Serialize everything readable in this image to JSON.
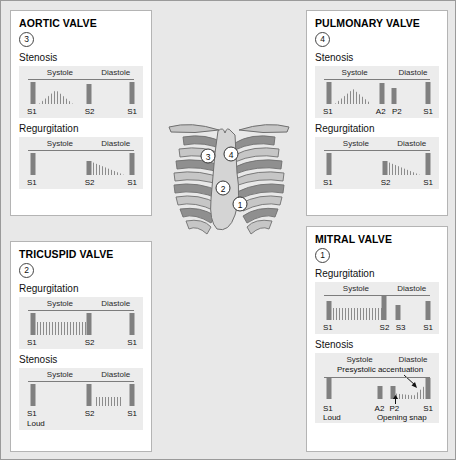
{
  "cards": {
    "aortic": {
      "title": "AORTIC VALVE",
      "site_number": "3",
      "lesions": [
        {
          "name": "Stenosis",
          "phases": [
            "Systole",
            "Diastole"
          ],
          "sounds": [
            "S1",
            "S2",
            "S1"
          ],
          "murmur_shape": "diamond",
          "murmur_phase": "systole"
        },
        {
          "name": "Regurgitation",
          "phases": [
            "Systole",
            "Diastole"
          ],
          "sounds": [
            "S1",
            "S2",
            "S1"
          ],
          "murmur_shape": "decrescendo",
          "murmur_phase": "diastole"
        }
      ]
    },
    "pulmonary": {
      "title": "PULMONARY VALVE",
      "site_number": "4",
      "lesions": [
        {
          "name": "Stenosis",
          "phases": [
            "Systole",
            "Diastole"
          ],
          "sounds": [
            "S1",
            "A2",
            "P2",
            "S1"
          ],
          "murmur_shape": "diamond",
          "murmur_phase": "systole"
        },
        {
          "name": "Regurgitation",
          "phases": [
            "Systole",
            "Diastole"
          ],
          "sounds": [
            "S1",
            "S2",
            "S1"
          ],
          "murmur_shape": "decrescendo",
          "murmur_phase": "diastole"
        }
      ]
    },
    "tricuspid": {
      "title": "TRICUSPID VALVE",
      "site_number": "2",
      "lesions": [
        {
          "name": "Regurgitation",
          "phases": [
            "Systole",
            "Diastole"
          ],
          "sounds": [
            "S1",
            "S2",
            "S1"
          ],
          "murmur_shape": "holosystolic-plateau",
          "murmur_phase": "systole"
        },
        {
          "name": "Stenosis",
          "phases": [
            "Systole",
            "Diastole"
          ],
          "sounds": [
            "S1",
            "S2",
            "S1"
          ],
          "sound_notes": [
            "Loud",
            "",
            ""
          ],
          "murmur_shape": "mid-diastolic-rumble",
          "murmur_phase": "diastole"
        }
      ]
    },
    "mitral": {
      "title": "MITRAL VALVE",
      "site_number": "1",
      "lesions": [
        {
          "name": "Regurgitation",
          "phases": [
            "Systole",
            "Diastole"
          ],
          "sounds": [
            "S1",
            "S2",
            "S3",
            "S1"
          ],
          "murmur_shape": "holosystolic-plateau",
          "murmur_phase": "systole"
        },
        {
          "name": "Stenosis",
          "phases": [
            "Systole",
            "Diastole"
          ],
          "sounds": [
            "S1",
            "A2",
            "P2",
            "S1"
          ],
          "sound_notes": [
            "Loud",
            "",
            "",
            ""
          ],
          "annotations": [
            "Presystolic accentuation",
            "Opening snap"
          ],
          "murmur_shape": "rumble-with-presystolic-accentuation",
          "murmur_phase": "diastole"
        }
      ]
    }
  },
  "thorax": {
    "description": "Anterior chest wall with rib cage, clavicles and sternum",
    "markers": [
      {
        "id": "1",
        "label": "1",
        "valve": "mitral"
      },
      {
        "id": "2",
        "label": "2",
        "valve": "tricuspid"
      },
      {
        "id": "3",
        "label": "3",
        "valve": "aortic"
      },
      {
        "id": "4",
        "label": "4",
        "valve": "pulmonary"
      }
    ]
  },
  "colors": {
    "page_background": "#e8e8e8",
    "card_background": "#ffffff",
    "panel_background": "#ececec",
    "bar": "#808080",
    "murmur": "#8c8c8c",
    "baseline": "#7d7d7d",
    "rib_dark": "#8f8f8f",
    "rib_light": "#c6c6c6",
    "sternum": "#d4d4d4"
  }
}
